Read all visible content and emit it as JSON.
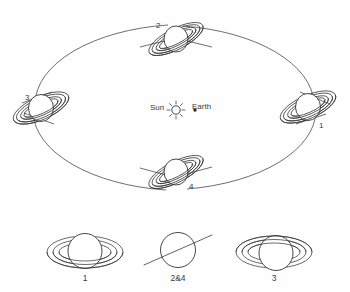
{
  "figure": {
    "background_color": "#fefefe",
    "line_color": "#3a3a3a"
  },
  "orbit": {
    "center_label_sun": "Sun",
    "center_label_earth": "Earth",
    "sun_icon": "sun-icon",
    "earth_icon": "earth-dot-icon",
    "positions": [
      {
        "id": "pos-1",
        "label": "1",
        "angle_deg": 0,
        "description": "right of orbit, rings open tilted"
      },
      {
        "id": "pos-2",
        "label": "2",
        "angle_deg": 90,
        "description": "top of orbit, rings edge-on"
      },
      {
        "id": "pos-3",
        "label": "3",
        "angle_deg": 180,
        "description": "left of orbit, rings open opposite tilt"
      },
      {
        "id": "pos-4",
        "label": "4",
        "angle_deg": 270,
        "description": "bottom of orbit, rings edge-on"
      }
    ]
  },
  "appearances": {
    "items": [
      {
        "id": "view-1",
        "label": "1",
        "description": "rings open, south face visible"
      },
      {
        "id": "view-24",
        "label": "2&4",
        "description": "rings edge-on, seen as a thin line"
      },
      {
        "id": "view-3",
        "label": "3",
        "description": "rings open, north face visible"
      }
    ]
  }
}
